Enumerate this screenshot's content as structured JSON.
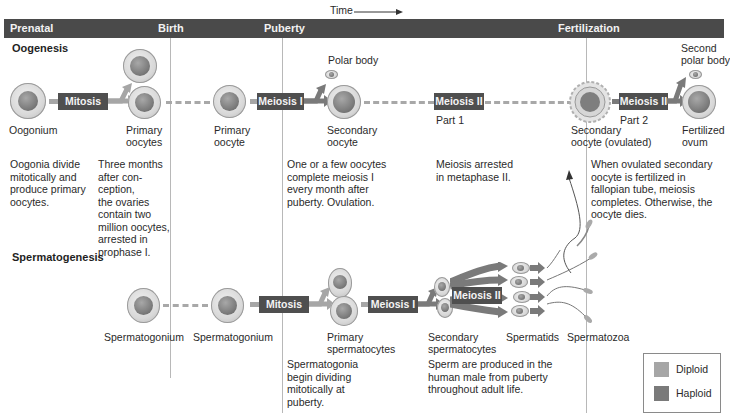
{
  "time_label": "Time",
  "timeline": {
    "prenatal": "Prenatal",
    "birth": "Birth",
    "puberty": "Puberty",
    "fertilization": "Fertilization"
  },
  "oogenesis": {
    "title": "Oogenesis",
    "labels": {
      "oogonium": "Oogonium",
      "primary_oocytes_1": "Primary",
      "primary_oocytes_2": "oocytes",
      "primary_oocyte_1": "Primary",
      "primary_oocyte_2": "oocyte",
      "polar_body": "Polar body",
      "secondary_oocyte_1": "Secondary",
      "secondary_oocyte_2": "oocyte",
      "part1": "Part 1",
      "secondary_ovulated_1": "Secondary",
      "secondary_ovulated_2": "oocyte (ovulated)",
      "part2": "Part 2",
      "second_polar_1": "Second",
      "second_polar_2": "polar body",
      "fertilized_1": "Fertilized",
      "fertilized_2": "ovum"
    },
    "processes": {
      "mitosis": "Mitosis",
      "meiosis1": "Meiosis I",
      "meiosis2_part1": "Meiosis II",
      "meiosis2_part2": "Meiosis II"
    },
    "notes": {
      "prenatal": [
        "Oogonia divide",
        "mitotically and",
        "produce primary",
        "oocytes."
      ],
      "birth": [
        "Three months",
        "after con-",
        "ception,",
        "the ovaries",
        "contain two",
        "million oocytes,",
        "arrested in",
        "prophase I."
      ],
      "puberty": [
        "One or a few oocytes",
        "complete meiosis I",
        "every month after",
        "puberty. Ovulation."
      ],
      "arrest": [
        "Meiosis arrested",
        "in metaphase II."
      ],
      "fertilization": [
        "When ovulated secondary",
        "oocyte is fertilized in",
        "fallopian tube, meiosis",
        "completes. Otherwise, the",
        "oocyte dies."
      ]
    }
  },
  "spermatogenesis": {
    "title": "Spermatogenesis",
    "labels": {
      "spermatogonium_1": "Spermatogonium",
      "spermatogonium_2": "Spermatogonium",
      "primary_1": "Primary",
      "primary_2": "spermatocytes",
      "secondary_1": "Secondary",
      "secondary_2": "spermatocytes",
      "spermatids": "Spermatids",
      "spermatozoa": "Spermatozoa"
    },
    "processes": {
      "mitosis": "Mitosis",
      "meiosis1": "Meiosis I",
      "meiosis2": "Meiosis II"
    },
    "notes": {
      "puberty": [
        "Spermatogonia",
        "begin dividing",
        "mitotically at",
        "puberty."
      ],
      "sperm": [
        "Sperm are produced in the",
        "human male from puberty",
        "throughout adult life."
      ]
    }
  },
  "legend": {
    "items": [
      {
        "label": "Diploid",
        "color": "#a6a6a6"
      },
      {
        "label": "Haploid",
        "color": "#7a7a7a"
      }
    ]
  },
  "colors": {
    "header_bar": "#4a4a4a",
    "process_box": "#4f4f4f",
    "diploid_arrow": "#a6a6a6",
    "haploid_arrow": "#7a7a7a"
  }
}
